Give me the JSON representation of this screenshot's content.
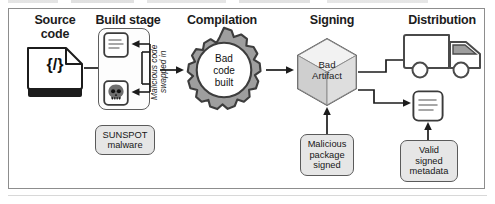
{
  "figure": {
    "type": "process-flow-diagram"
  },
  "stages": [
    {
      "id": "source",
      "header": "Source\ncode"
    },
    {
      "id": "build",
      "header": "Build stage"
    },
    {
      "id": "compilation",
      "header": "Compilation"
    },
    {
      "id": "signing",
      "header": "Signing"
    },
    {
      "id": "distribution",
      "header": "Distribution"
    }
  ],
  "nodes": {
    "source_code_doc": {
      "label": "{/}",
      "icon": "code-document-icon"
    },
    "build_source_doc": {
      "label": "",
      "icon": "document-lines-icon"
    },
    "build_malware_doc": {
      "label": "",
      "icon": "skull-document-icon"
    },
    "sunspot": {
      "label": "SUNSPOT\nmalware"
    },
    "gear": {
      "label": "Bad\ncode\nbuilt",
      "icon": "gear-icon"
    },
    "artifact": {
      "label": "Bad\nArtifact",
      "icon": "cube-icon"
    },
    "malicious_package": {
      "label": "Malicious\npackage\nsigned"
    },
    "truck": {
      "label": "",
      "icon": "delivery-truck-icon"
    },
    "metadata_doc": {
      "label": "",
      "icon": "document-lines-icon"
    },
    "valid_metadata": {
      "label": "Valid\nsigned\nmetadata"
    }
  },
  "annotations": {
    "swap_note": "Malicious code\nswapped in"
  },
  "colors": {
    "ink": "#1b1b1b",
    "stroke": "#5a5a5a",
    "box_fill": "#e6e6e6",
    "gear_fill": "#9e9e9e",
    "frame": "#8d8d8d",
    "white": "#ffffff"
  }
}
